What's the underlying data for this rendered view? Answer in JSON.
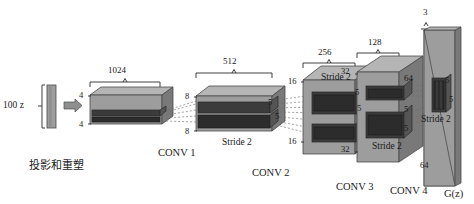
{
  "figure": {
    "type": "diagram",
    "background_color": "#ffffff",
    "ink_color": "#1a1a1a"
  },
  "input": {
    "label": "100 z",
    "reshape_caption": "投影和重塑",
    "arrow_icon": "right-arrow-icon"
  },
  "blocks": [
    {
      "id": "projection",
      "channels": "1024",
      "spatial_top": "4",
      "spatial_bottom": "4",
      "name": "",
      "stride": "",
      "kernel": ""
    },
    {
      "id": "conv1",
      "channels": "512",
      "spatial_top": "8",
      "spatial_bottom": "8",
      "name": "CONV 1",
      "stride": "Stride 2",
      "kernel": "5"
    },
    {
      "id": "conv2",
      "channels": "256",
      "spatial_top": "16",
      "spatial_bottom": "16",
      "name": "CONV 2",
      "stride": "Stride 2",
      "kernel": "5"
    },
    {
      "id": "conv3",
      "channels": "128",
      "spatial_top": "32",
      "spatial_bottom": "32",
      "name": "CONV 3",
      "stride": "Stride 2",
      "kernel": "5"
    },
    {
      "id": "conv4",
      "channels": "64",
      "spatial_top": "64",
      "spatial_bottom": "64",
      "name": "CONV 4",
      "stride": "Stride 2",
      "kernel": "5"
    }
  ],
  "output": {
    "channels": "3",
    "spatial_top": "64",
    "spatial_bottom": "64",
    "label": "G(z)",
    "kernel_top": "5",
    "kernel_bottom": "5",
    "stride": "Stride 2"
  },
  "kernel_marks": {
    "conv1_out": "5",
    "conv2_in": "5",
    "conv2_out_top": "5",
    "conv2_out_bottom": "5",
    "conv3_in_top": "5",
    "conv3_in_bottom": "5",
    "conv4_in_top": "5",
    "conv4_in_bottom": "5"
  },
  "palette": {
    "face_light": "#b5b5b5",
    "face_mid": "#9a9a9a",
    "face_dark": "#6f6f6f",
    "inner_dark": "#3a3a3a",
    "inner_darker": "#2b2b2b",
    "edge": "#4a4a4a",
    "zbar": "#9a9a9a"
  }
}
